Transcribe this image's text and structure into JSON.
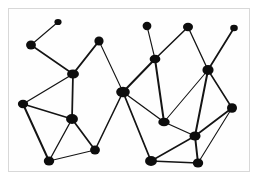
{
  "figure": {
    "title": "",
    "type": "node-link-graph",
    "background_color": "#ffffff",
    "frame_color": "#d8d8d8",
    "node_color": "#0d0d0d",
    "edge_color": "#141414",
    "width": 262,
    "height": 187,
    "node_count": 24,
    "edge_count": 39
  },
  "graph_data": {
    "type": "graph",
    "nodes": [
      {
        "id": "n1",
        "x": 58,
        "y": 22,
        "r": 3.6
      },
      {
        "id": "n2",
        "x": 31,
        "y": 45,
        "r": 4.6
      },
      {
        "id": "n3",
        "x": 73,
        "y": 74,
        "r": 5.2
      },
      {
        "id": "n4",
        "x": 99,
        "y": 41,
        "r": 4.6
      },
      {
        "id": "n5",
        "x": 23,
        "y": 104,
        "r": 4.8
      },
      {
        "id": "n6",
        "x": 72,
        "y": 119,
        "r": 5.2
      },
      {
        "id": "n7",
        "x": 49,
        "y": 161,
        "r": 5.2
      },
      {
        "id": "n8",
        "x": 95,
        "y": 150,
        "r": 4.6
      },
      {
        "id": "n9",
        "x": 123,
        "y": 92,
        "r": 6.0
      },
      {
        "id": "n10",
        "x": 147,
        "y": 26,
        "r": 4.4
      },
      {
        "id": "n11",
        "x": 155,
        "y": 59,
        "r": 5.0
      },
      {
        "id": "n12",
        "x": 188,
        "y": 27,
        "r": 4.4
      },
      {
        "id": "n13",
        "x": 234,
        "y": 28,
        "r": 3.8
      },
      {
        "id": "n14",
        "x": 208,
        "y": 70,
        "r": 5.2
      },
      {
        "id": "n15",
        "x": 164,
        "y": 122,
        "r": 5.0
      },
      {
        "id": "n16",
        "x": 232,
        "y": 108,
        "r": 5.0
      },
      {
        "id": "n17",
        "x": 195,
        "y": 136,
        "r": 5.2
      },
      {
        "id": "n18",
        "x": 151,
        "y": 161,
        "r": 5.2
      },
      {
        "id": "n19",
        "x": 198,
        "y": 163,
        "r": 5.2
      }
    ],
    "edges": [
      {
        "source": "n1",
        "target": "n2"
      },
      {
        "source": "n2",
        "target": "n3"
      },
      {
        "source": "n3",
        "target": "n4"
      },
      {
        "source": "n3",
        "target": "n5"
      },
      {
        "source": "n3",
        "target": "n6"
      },
      {
        "source": "n4",
        "target": "n9"
      },
      {
        "source": "n5",
        "target": "n6"
      },
      {
        "source": "n5",
        "target": "n7"
      },
      {
        "source": "n6",
        "target": "n7"
      },
      {
        "source": "n6",
        "target": "n8"
      },
      {
        "source": "n7",
        "target": "n8"
      },
      {
        "source": "n8",
        "target": "n9"
      },
      {
        "source": "n9",
        "target": "n11"
      },
      {
        "source": "n9",
        "target": "n15"
      },
      {
        "source": "n9",
        "target": "n18"
      },
      {
        "source": "n10",
        "target": "n11"
      },
      {
        "source": "n11",
        "target": "n12"
      },
      {
        "source": "n11",
        "target": "n15"
      },
      {
        "source": "n12",
        "target": "n14"
      },
      {
        "source": "n13",
        "target": "n14"
      },
      {
        "source": "n14",
        "target": "n15"
      },
      {
        "source": "n14",
        "target": "n16"
      },
      {
        "source": "n14",
        "target": "n17"
      },
      {
        "source": "n15",
        "target": "n17"
      },
      {
        "source": "n16",
        "target": "n17"
      },
      {
        "source": "n16",
        "target": "n19"
      },
      {
        "source": "n17",
        "target": "n18"
      },
      {
        "source": "n17",
        "target": "n19"
      },
      {
        "source": "n18",
        "target": "n19"
      }
    ]
  }
}
